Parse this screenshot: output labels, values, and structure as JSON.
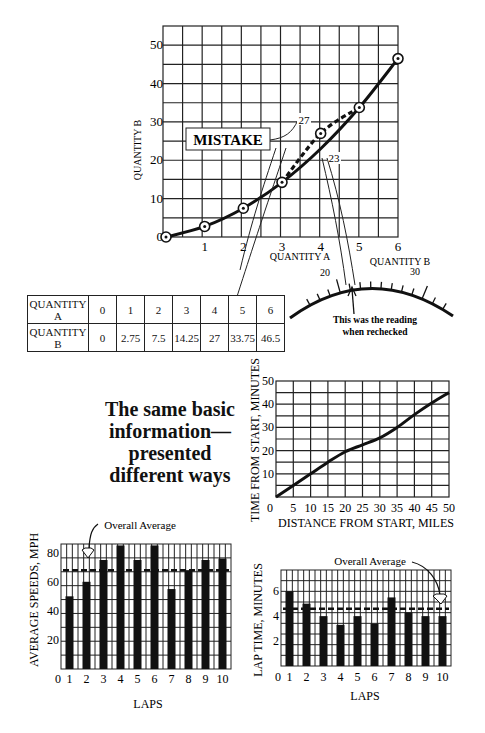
{
  "headline": {
    "lines": [
      "The same basic",
      "information—",
      "presented",
      "different ways"
    ]
  },
  "table": {
    "row_a_label": "QUANTITY A",
    "row_b_label": "QUANTITY B",
    "a_values": [
      "0",
      "1",
      "2",
      "3",
      "4",
      "5",
      "6"
    ],
    "b_values": [
      "0",
      "2.75",
      "7.5",
      "14.25",
      "27",
      "33.75",
      "46.5"
    ]
  },
  "gauge": {
    "title": "QUANTITY B",
    "tick_labels": [
      "20",
      "30"
    ],
    "caption_line1": "This was the reading",
    "caption_line2": "when rechecked"
  },
  "chart_data": [
    {
      "type": "line",
      "title": "",
      "xlabel": "QUANTITY A",
      "ylabel": "QUANTITY B",
      "x": [
        0,
        1,
        2,
        3,
        4,
        5,
        6
      ],
      "xticks": [
        "0",
        "1",
        "2",
        "3",
        "4",
        "5",
        "6"
      ],
      "yticks": [
        "0",
        "10",
        "20",
        "30",
        "40",
        "50"
      ],
      "xlim": [
        0,
        6
      ],
      "ylim": [
        0,
        55
      ],
      "grid": true,
      "series": [
        {
          "name": "Correct curve",
          "values": [
            0,
            2.75,
            7.5,
            14.25,
            23,
            33.75,
            46.5
          ],
          "style": "solid"
        },
        {
          "name": "Mistake (plotted)",
          "x": [
            3,
            4,
            5
          ],
          "values": [
            14.25,
            27,
            33.75
          ],
          "style": "dashed"
        }
      ],
      "annotations": [
        {
          "text": "MISTAKE",
          "points_to": "27"
        },
        {
          "text": "27",
          "x": 4,
          "y": 27
        },
        {
          "text": "23",
          "x": 4,
          "y": 23
        }
      ]
    },
    {
      "type": "line",
      "title": "",
      "xlabel": "DISTANCE FROM START, MILES",
      "ylabel": "TIME FROM START, MINUTES",
      "x": [
        0,
        5,
        10,
        15,
        20,
        25,
        30,
        35,
        40,
        45,
        50
      ],
      "xticks": [
        "0",
        "5",
        "10",
        "15",
        "20",
        "25",
        "30",
        "35",
        "40",
        "45",
        "50"
      ],
      "yticks": [
        "10",
        "20",
        "30",
        "40",
        "50"
      ],
      "xlim": [
        0,
        50
      ],
      "ylim": [
        0,
        50
      ],
      "grid": true,
      "series": [
        {
          "name": "Time",
          "values": [
            0,
            5,
            10,
            15,
            19.5,
            22.5,
            25.5,
            30,
            35.5,
            40.5,
            45
          ]
        }
      ]
    },
    {
      "type": "bar",
      "title": "",
      "xlabel": "LAPS",
      "ylabel": "AVERAGE SPEEDS, MPH",
      "categories": [
        "1",
        "2",
        "3",
        "4",
        "5",
        "6",
        "7",
        "8",
        "9",
        "10"
      ],
      "xticks": [
        "0",
        "1",
        "2",
        "3",
        "4",
        "5",
        "6",
        "7",
        "8",
        "9",
        "10"
      ],
      "yticks": [
        "20",
        "40",
        "60",
        "80"
      ],
      "values": [
        50,
        60,
        75,
        85,
        75,
        85,
        55,
        68,
        75,
        76
      ],
      "ylim": [
        0,
        90
      ],
      "grid": true,
      "reference_line": {
        "label": "Overall Average",
        "value": 68,
        "style": "dashed"
      }
    },
    {
      "type": "bar",
      "title": "",
      "xlabel": "LAPS",
      "ylabel": "LAP TIME, MINUTES",
      "categories": [
        "1",
        "2",
        "3",
        "4",
        "5",
        "6",
        "7",
        "8",
        "9",
        "10"
      ],
      "xticks": [
        "0",
        "1",
        "2",
        "3",
        "4",
        "5",
        "6",
        "7",
        "8",
        "9",
        "10"
      ],
      "yticks": [
        "2",
        "4",
        "6"
      ],
      "values": [
        6,
        5,
        4,
        3.3,
        4,
        3.4,
        5.5,
        4.3,
        4,
        4
      ],
      "ylim": [
        0,
        7.5
      ],
      "grid": true,
      "reference_line": {
        "label": "Overall Average",
        "value": 4.6,
        "style": "dashed"
      }
    }
  ]
}
